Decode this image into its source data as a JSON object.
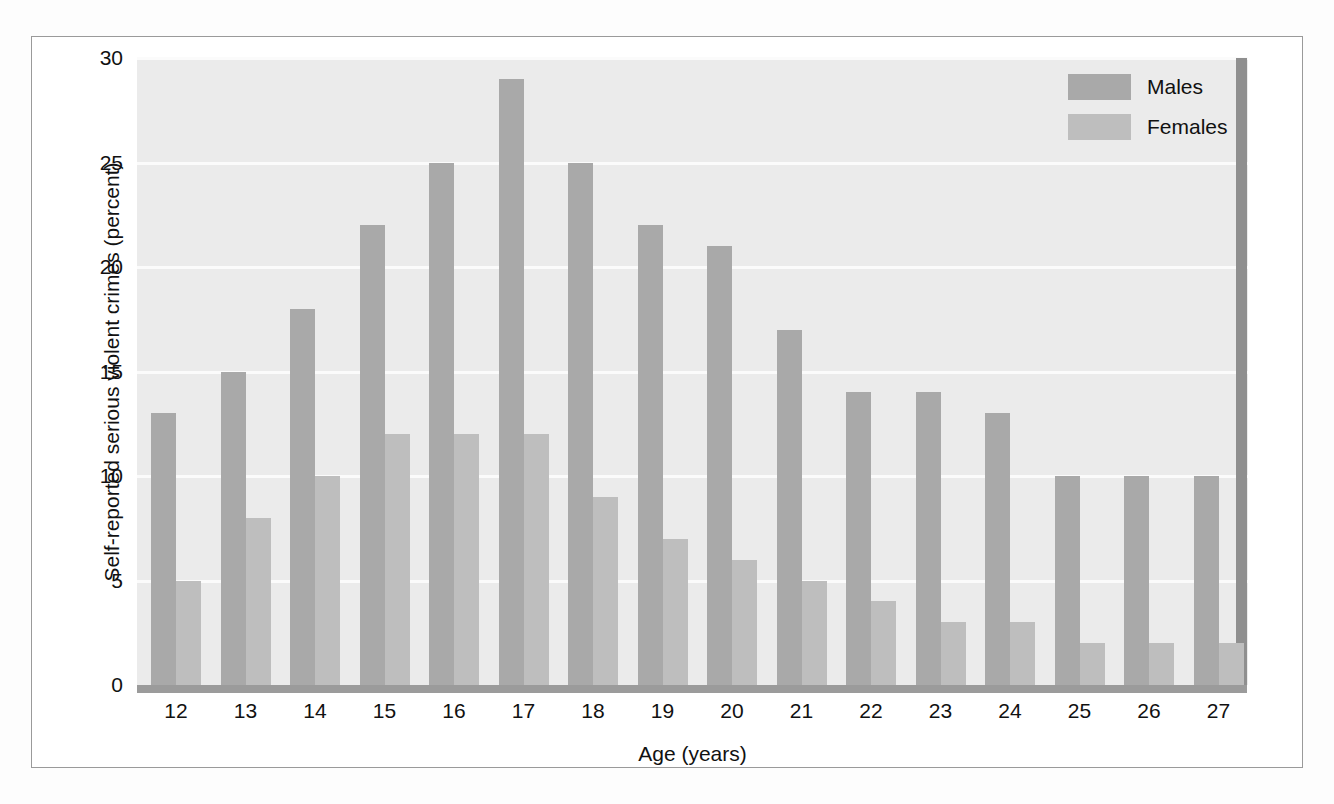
{
  "figure": {
    "frame_border_color": "#9a9a9a",
    "plot_background": "#ebebeb",
    "gridline_color": "#fbfbfb",
    "baseline_color": "#9b9b9b",
    "right_wall_color": "#8f8f8f"
  },
  "legend": {
    "position": "top-right",
    "items": [
      {
        "label": "Males",
        "color": "#a9a9a9",
        "swatch_name": "legend-swatch-males"
      },
      {
        "label": "Females",
        "color": "#bebebe",
        "swatch_name": "legend-swatch-females"
      }
    ]
  },
  "chart_data": {
    "type": "bar",
    "title": "",
    "subtitle": "",
    "xlabel": "Age (years)",
    "ylabel": "Self-reported serious violent crimes (percent)",
    "categories": [
      "12",
      "13",
      "14",
      "15",
      "16",
      "17",
      "18",
      "19",
      "20",
      "21",
      "22",
      "23",
      "24",
      "25",
      "26",
      "27"
    ],
    "series": [
      {
        "name": "Males",
        "color": "#a9a9a9",
        "values": [
          13,
          15,
          18,
          22,
          25,
          29,
          25,
          22,
          21,
          17,
          14,
          14,
          13,
          10,
          10,
          10
        ]
      },
      {
        "name": "Females",
        "color": "#bebebe",
        "values": [
          5,
          8,
          10,
          12,
          12,
          12,
          9,
          7,
          6,
          5,
          4,
          3,
          3,
          2,
          2,
          2
        ]
      }
    ],
    "ylim": [
      0,
      30
    ],
    "yticks": [
      0,
      5,
      10,
      15,
      20,
      25,
      30
    ],
    "ytick_labels": [
      "0",
      "5",
      "10",
      "15",
      "20",
      "25",
      "30"
    ],
    "xtick_labels": [
      "12",
      "13",
      "14",
      "15",
      "16",
      "17",
      "18",
      "19",
      "20",
      "21",
      "22",
      "23",
      "24",
      "25",
      "26",
      "27"
    ],
    "grid": "horizontal",
    "legend_position": "top-right"
  }
}
